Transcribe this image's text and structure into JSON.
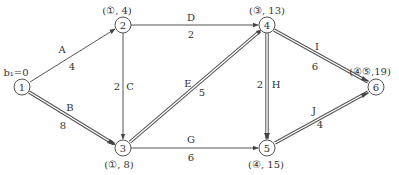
{
  "diagram": {
    "type": "network-critical-path",
    "start_label": "b₁=0",
    "nodes": [
      {
        "id": "1",
        "x": 22,
        "y": 87,
        "label": ""
      },
      {
        "id": "2",
        "x": 123,
        "y": 25,
        "label": "(①, 4)"
      },
      {
        "id": "3",
        "x": 123,
        "y": 148,
        "label": "(①, 8)"
      },
      {
        "id": "4",
        "x": 267,
        "y": 25,
        "label": "(③, 13)"
      },
      {
        "id": "5",
        "x": 267,
        "y": 148,
        "label": "(④, 15)"
      },
      {
        "id": "6",
        "x": 376,
        "y": 87,
        "label": "(④⑤,19)"
      }
    ],
    "edges": [
      {
        "name": "A",
        "from": "1",
        "to": "2",
        "weight": "4",
        "critical": false
      },
      {
        "name": "B",
        "from": "1",
        "to": "3",
        "weight": "8",
        "critical": true
      },
      {
        "name": "C",
        "from": "2",
        "to": "3",
        "weight": "2",
        "critical": false
      },
      {
        "name": "D",
        "from": "2",
        "to": "4",
        "weight": "2",
        "critical": false
      },
      {
        "name": "E",
        "from": "3",
        "to": "4",
        "weight": "5",
        "critical": true
      },
      {
        "name": "G",
        "from": "3",
        "to": "5",
        "weight": "6",
        "critical": false
      },
      {
        "name": "H",
        "from": "4",
        "to": "5",
        "weight": "2",
        "critical": true
      },
      {
        "name": "I",
        "from": "4",
        "to": "6",
        "weight": "6",
        "critical": true
      },
      {
        "name": "J",
        "from": "5",
        "to": "6",
        "weight": "4",
        "critical": true
      }
    ]
  }
}
